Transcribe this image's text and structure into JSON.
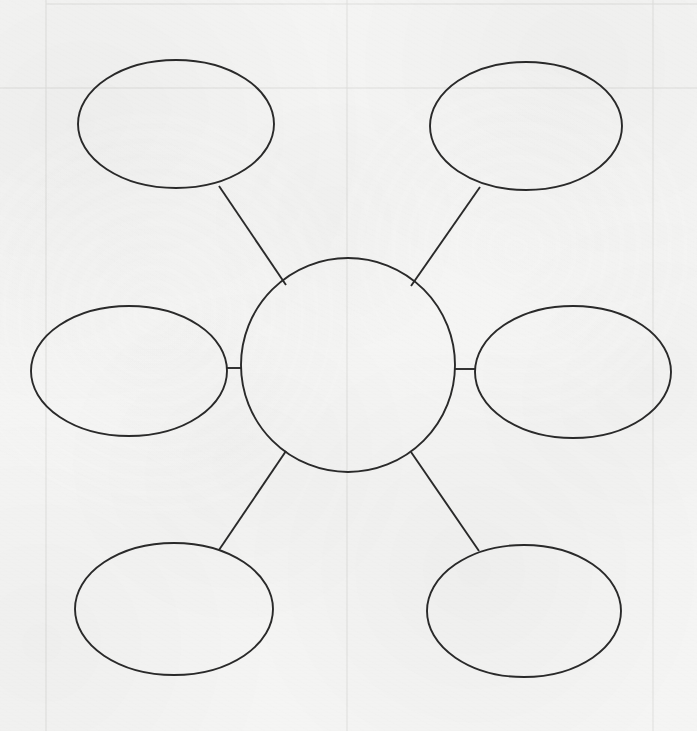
{
  "document": {
    "title": "Concept Web Graphic Organizer",
    "sheet_background_color": "#f5f5f4",
    "ink_color": "#2a2a2a",
    "guide_line_color": "#dfdfdd",
    "canvas_width": 697,
    "canvas_height": 731
  },
  "diagram": {
    "type": "concept-web",
    "center": {
      "label": "",
      "shape": "circle",
      "cx": 348,
      "cy": 365,
      "r": 107
    },
    "nodes": [
      {
        "id": "node-top-left",
        "label": "",
        "shape": "ellipse",
        "cx": 176,
        "cy": 124,
        "rx": 98,
        "ry": 64
      },
      {
        "id": "node-top-right",
        "label": "",
        "shape": "ellipse",
        "cx": 526,
        "cy": 126,
        "rx": 96,
        "ry": 64
      },
      {
        "id": "node-middle-left",
        "label": "",
        "shape": "ellipse",
        "cx": 129,
        "cy": 371,
        "rx": 98,
        "ry": 65
      },
      {
        "id": "node-middle-right",
        "label": "",
        "shape": "ellipse",
        "cx": 573,
        "cy": 372,
        "rx": 98,
        "ry": 66
      },
      {
        "id": "node-bottom-left",
        "label": "",
        "shape": "ellipse",
        "cx": 174,
        "cy": 609,
        "rx": 99,
        "ry": 66
      },
      {
        "id": "node-bottom-right",
        "label": "",
        "shape": "ellipse",
        "cx": 524,
        "cy": 611,
        "rx": 97,
        "ry": 66
      }
    ],
    "connectors": [
      {
        "id": "connector-top-left",
        "from": "node-top-left",
        "to": "center",
        "x1": 219,
        "y1": 186,
        "x2": 286,
        "y2": 285
      },
      {
        "id": "connector-top-right",
        "from": "node-top-right",
        "to": "center",
        "x1": 480,
        "y1": 187,
        "x2": 411,
        "y2": 286
      },
      {
        "id": "connector-middle-left",
        "from": "node-middle-left",
        "to": "center",
        "x1": 227,
        "y1": 368,
        "x2": 241,
        "y2": 368
      },
      {
        "id": "connector-middle-right",
        "from": "node-middle-right",
        "to": "center",
        "x1": 455,
        "y1": 369,
        "x2": 476,
        "y2": 369
      },
      {
        "id": "connector-bottom-left",
        "from": "node-bottom-left",
        "to": "center",
        "x1": 286,
        "y1": 451,
        "x2": 219,
        "y2": 550
      },
      {
        "id": "connector-bottom-right",
        "from": "node-bottom-right",
        "to": "center",
        "x1": 411,
        "y1": 452,
        "x2": 479,
        "y2": 551
      }
    ],
    "guide_lines": [
      {
        "id": "guide-top-horizontal",
        "orientation": "horizontal",
        "x1": 46,
        "y1": 4,
        "x2": 697,
        "y2": 4
      },
      {
        "id": "guide-upper-horizontal",
        "orientation": "horizontal",
        "x1": 0,
        "y1": 88,
        "x2": 697,
        "y2": 88
      },
      {
        "id": "guide-left-vertical",
        "orientation": "vertical",
        "x1": 46,
        "y1": 0,
        "x2": 46,
        "y2": 731
      },
      {
        "id": "guide-mid-vertical",
        "orientation": "vertical",
        "x1": 347,
        "y1": 0,
        "x2": 347,
        "y2": 731
      },
      {
        "id": "guide-right-vertical",
        "orientation": "vertical",
        "x1": 653,
        "y1": 0,
        "x2": 653,
        "y2": 731
      }
    ]
  }
}
